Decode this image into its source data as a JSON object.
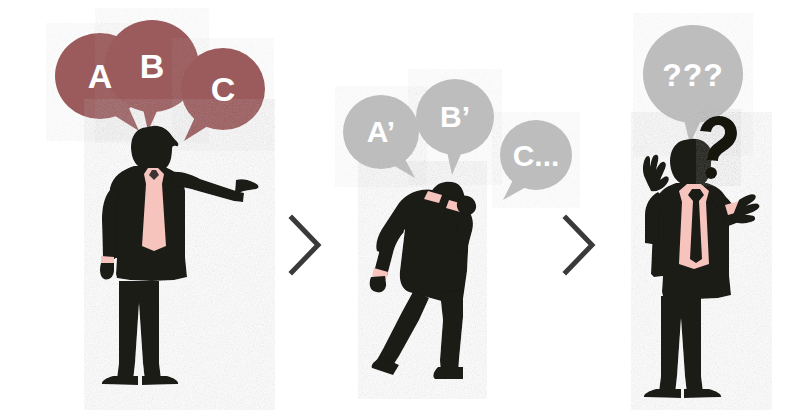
{
  "illustration": {
    "title": "Miscommunication cascade",
    "background_color": "#ffffff",
    "palette": {
      "bubble_red": "#9b5a5c",
      "bubble_gray": "#bdbdbd",
      "figure_black": "#1d1a19",
      "shirt_pink": "#f7c4bd",
      "chevron_gray": "#3b3a3a",
      "text_white": "#ffffff",
      "question_black": "#141211"
    },
    "panels": [
      {
        "id": "panel-1",
        "name": "speaker",
        "figure": "businessman-pointing-right",
        "figure_description": "Standing businessman in black suit with pink shirt and pink tie, right arm extended pointing to the right.",
        "bubbles": [
          {
            "id": "bubble-a",
            "label": "A",
            "color": "#9b5a5c",
            "tail": "bottom-right",
            "font_size": 34
          },
          {
            "id": "bubble-b",
            "label": "B",
            "color": "#9b5a5c",
            "tail": "bottom-center",
            "font_size": 34
          },
          {
            "id": "bubble-c",
            "label": "C",
            "color": "#9b5a5c",
            "tail": "bottom-left",
            "font_size": 34
          }
        ]
      },
      {
        "id": "panel-2",
        "name": "messenger",
        "figure": "businessman-hunched-walking",
        "figure_description": "Hunched businessman in black suit walking to the right, one hand raised to his head, pink cuffs visible.",
        "bubbles": [
          {
            "id": "bubble-a-prime",
            "label": "A’",
            "color": "#bdbdbd",
            "tail": "bottom-right",
            "font_size": 30
          },
          {
            "id": "bubble-b-prime",
            "label": "B’",
            "color": "#bdbdbd",
            "tail": "bottom-center",
            "font_size": 30
          },
          {
            "id": "bubble-c-ellipsis",
            "label": "C...",
            "color": "#bdbdbd",
            "tail": "bottom-left",
            "font_size": 30
          }
        ]
      },
      {
        "id": "panel-3",
        "name": "confused-listener",
        "figure": "businessman-shrugging",
        "figure_description": "Standing businessman in black suit with pink shirt and black tie, both arms raised in a shrug, a question mark floating beside his head.",
        "bubbles": [
          {
            "id": "bubble-questions",
            "label": "???",
            "color": "#bdbdbd",
            "tail": "bottom-center",
            "font_size": 30
          }
        ],
        "annotations": [
          {
            "id": "question-mark",
            "label": "?",
            "color": "#141211",
            "font_size": 46
          }
        ]
      }
    ],
    "separators": [
      {
        "id": "chevron-1",
        "glyph": "chevron-right",
        "color": "#3b3a3a"
      },
      {
        "id": "chevron-2",
        "glyph": "chevron-right",
        "color": "#3b3a3a"
      }
    ]
  }
}
